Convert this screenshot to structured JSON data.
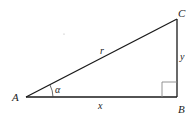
{
  "diagram": {
    "type": "right-triangle",
    "vertices": {
      "A": {
        "label": "A"
      },
      "B": {
        "label": "B"
      },
      "C": {
        "label": "C"
      }
    },
    "sides": {
      "hypotenuse": {
        "label": "r"
      },
      "opposite": {
        "label": "y"
      },
      "adjacent": {
        "label": "x"
      }
    },
    "angle": {
      "label": "α"
    },
    "colors": {
      "stroke": "#1a1a1a",
      "box": "#888888"
    }
  }
}
